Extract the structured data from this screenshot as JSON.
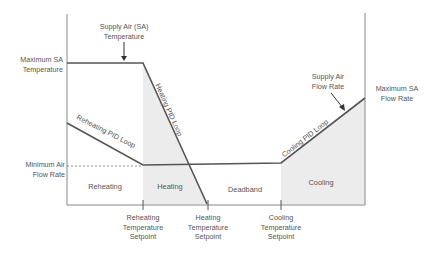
{
  "diagram": {
    "colors": {
      "line": "#555555",
      "axis": "#888888",
      "shade": "#ececec",
      "text": "#555555"
    },
    "left_axis_labels": {
      "max_sa_temp": [
        "Maximum SA",
        "Temperature"
      ],
      "min_air_flow": [
        "Minimum Air",
        "Flow Rate"
      ]
    },
    "right_axis_labels": {
      "max_sa_flow": [
        "Maximum SA",
        "Flow Rate"
      ]
    },
    "callouts": {
      "supply_air_temp": [
        "Supply Air (SA)",
        "Temperature"
      ],
      "supply_air_flow": [
        "Supply Air",
        "Flow Rate"
      ]
    },
    "loop_labels": {
      "reheating": "Reheating PID Loop",
      "heating": "Heating PID Loop",
      "cooling": "Cooling PID Loop"
    },
    "regions": {
      "reheating": "Reheating",
      "heating": "Heating",
      "deadband": "Deadband",
      "cooling": "Cooling"
    },
    "setpoints": {
      "reheating": [
        "Reheating",
        "Temperature",
        "Setpoint"
      ],
      "heating": [
        "Heating",
        "Temperature",
        "Setpoint"
      ],
      "cooling": [
        "Cooling",
        "Temperature",
        "Setpoint"
      ]
    }
  }
}
